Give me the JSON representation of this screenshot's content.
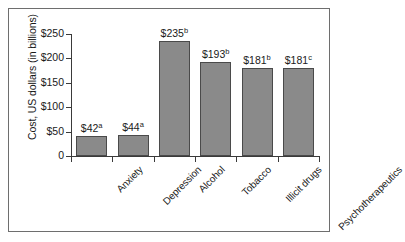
{
  "chart_data": {
    "type": "bar",
    "title": "",
    "subtitle": "",
    "xlabel": "",
    "ylabel": "Cost, US dollars (in billions)",
    "ylim": [
      0,
      250
    ],
    "ytick_values": [
      0,
      50,
      100,
      150,
      200,
      250
    ],
    "ytick_labels": [
      "0",
      "$50",
      "$100",
      "$150",
      "$200",
      "$250"
    ],
    "grid": false,
    "legend": null,
    "categories": [
      "Anxiety",
      "Depression",
      "Alcohol",
      "Tobacco",
      "Illicit drugs",
      "Psychotherapeutics"
    ],
    "values": [
      42,
      44,
      235,
      193,
      181,
      181
    ],
    "data_labels": [
      "$42",
      "$44",
      "$235",
      "$193",
      "$181",
      "$181"
    ],
    "data_label_superscripts": [
      "a",
      "a",
      "b",
      "b",
      "b",
      "c"
    ],
    "bar_fill_color": "#8a8a8a",
    "bar_border_color": "#4a4a4a",
    "axis_color": "#3a3a3a",
    "text_color": "#1a1a1a",
    "background_color": "#ffffff",
    "frame_color": "#6e6e6e"
  }
}
